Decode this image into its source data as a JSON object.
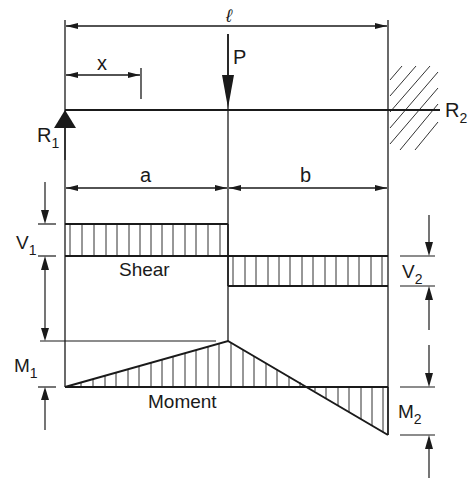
{
  "diagram": {
    "colors": {
      "line": "#1a1a1a",
      "hatch": "#333333",
      "background": "#ffffff"
    },
    "labels": {
      "span": "ℓ",
      "x": "x",
      "load": "P",
      "r1": "R",
      "r1_sub": "1",
      "r2": "R",
      "r2_sub": "2",
      "a": "a",
      "b": "b",
      "v1": "V",
      "v1_sub": "1",
      "v2": "V",
      "v2_sub": "2",
      "shear": "Shear",
      "m1": "M",
      "m1_sub": "1",
      "m2": "M",
      "m2_sub": "2",
      "moment": "Moment"
    },
    "elements": {
      "support_left": "pin-triangle",
      "support_right": "fixed-wall-hatched",
      "shear_diagram": {
        "left_segment": "positive V1 over a",
        "right_segment": "negative V2 over b"
      },
      "moment_diagram": {
        "peak": "M1 at load point",
        "end": "-M2 at fixed end"
      }
    }
  }
}
